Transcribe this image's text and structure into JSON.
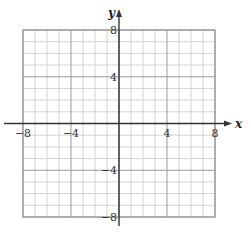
{
  "graph": {
    "x_axis": {
      "label": "x",
      "min": -8,
      "max": 8,
      "ticks": [
        {
          "value": -8,
          "label": "−8"
        },
        {
          "value": -4,
          "label": "−4"
        },
        {
          "value": 4,
          "label": "4"
        },
        {
          "value": 8,
          "label": "8"
        }
      ]
    },
    "y_axis": {
      "label": "y",
      "min": -8,
      "max": 8,
      "ticks": [
        {
          "value": 8,
          "label": "8"
        },
        {
          "value": 4,
          "label": "4"
        },
        {
          "value": -4,
          "label": "−4"
        },
        {
          "value": -8,
          "label": "−8"
        }
      ]
    },
    "grid": {
      "minor_step": 1,
      "major_step": 4
    },
    "colors": {
      "minor_grid": "#d4d4d4",
      "major_grid": "#9a9a9a",
      "axis": "#333333",
      "border": "#9a9a9a"
    }
  }
}
